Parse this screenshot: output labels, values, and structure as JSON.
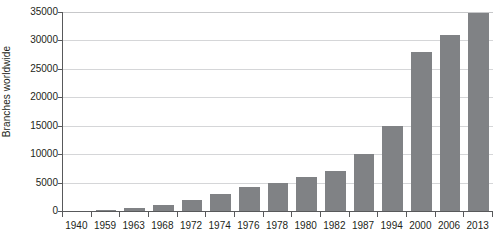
{
  "chart_data": {
    "type": "bar",
    "title": "",
    "xlabel": "",
    "ylabel": "Branches worldwide",
    "categories": [
      "1940",
      "1959",
      "1963",
      "1968",
      "1972",
      "1974",
      "1976",
      "1978",
      "1980",
      "1982",
      "1987",
      "1994",
      "2000",
      "2006",
      "2013"
    ],
    "values": [
      0,
      100,
      600,
      1100,
      2000,
      3000,
      4200,
      5000,
      6000,
      7000,
      10000,
      15000,
      28000,
      31000,
      34800
    ],
    "ylim": [
      0,
      35000
    ],
    "y_ticks": [
      0,
      5000,
      10000,
      15000,
      20000,
      25000,
      30000,
      35000
    ],
    "y_tick_labels": [
      "0",
      "5000",
      "10000",
      "15000",
      "20000",
      "25000",
      "30000",
      "35000"
    ],
    "grid": true,
    "legend": null,
    "series_color": "#808285",
    "gridline_color": "#d5d6d8",
    "axis_color": "#58595b"
  }
}
